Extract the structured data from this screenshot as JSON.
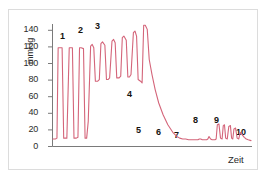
{
  "figure": {
    "background_color": "#ffffff",
    "border_color": "#dcdcdc",
    "trace_color": "#d4657a",
    "axis_color": "#7a7a7a",
    "label_color": "#15120f"
  },
  "axes": {
    "y_title": "mmHg",
    "x_title": "Zeit",
    "y_ticks": [
      "0",
      "20",
      "40",
      "60",
      "80",
      "100",
      "120",
      "140"
    ]
  },
  "annotations": [
    {
      "id": "1",
      "label": "1"
    },
    {
      "id": "2",
      "label": "2"
    },
    {
      "id": "3",
      "label": "3"
    },
    {
      "id": "4",
      "label": "4"
    },
    {
      "id": "5",
      "label": "5"
    },
    {
      "id": "6",
      "label": "6"
    },
    {
      "id": "7",
      "label": "7"
    },
    {
      "id": "8",
      "label": "8"
    },
    {
      "id": "9",
      "label": "9"
    },
    {
      "id": "10",
      "label": "10"
    }
  ],
  "chart_data": {
    "type": "line",
    "title": "",
    "subtitle": "",
    "xlabel": "Zeit",
    "ylabel": "mmHg",
    "ylim": [
      0,
      150
    ],
    "xlim": [
      0,
      100
    ],
    "yticks": [
      0,
      20,
      40,
      60,
      80,
      100,
      120,
      140
    ],
    "xticks": [],
    "grid": false,
    "legend": null,
    "series": [
      {
        "name": "Arterieller Druckverlauf",
        "color": "#d4657a",
        "x": [
          0.0,
          1.2,
          2.0,
          2.6,
          3.4,
          4.6,
          5.4,
          6.2,
          7.0,
          8.2,
          9.0,
          9.8,
          10.6,
          11.8,
          12.6,
          13.4,
          14.2,
          15.4,
          16.2,
          17.0,
          17.8,
          19.0,
          19.8,
          20.6,
          21.4,
          22.6,
          23.4,
          24.2,
          25.0,
          26.2,
          27.0,
          27.8,
          28.6,
          29.8,
          30.6,
          31.4,
          32.2,
          33.4,
          34.2,
          35.0,
          35.8,
          37.0,
          37.8,
          38.6,
          39.4,
          40.6,
          41.4,
          42.2,
          43.0,
          44.2,
          45.0,
          45.8,
          46.6,
          47.6,
          48.6,
          50.0,
          51.6,
          53.4,
          55.6,
          58.0,
          60.5,
          62.5,
          64.0,
          65.5,
          67.0,
          68.5,
          70.0,
          71.5,
          72.5,
          73.2,
          73.9,
          74.6,
          75.4,
          76.2,
          77.0,
          77.6,
          78.2,
          78.8,
          79.6,
          80.4,
          81.2,
          81.8,
          82.4,
          83.0,
          83.8,
          84.6,
          85.4,
          86.0,
          86.6,
          87.2,
          88.0,
          88.8,
          89.6,
          90.2,
          90.8,
          91.4,
          92.2,
          93.0,
          93.8,
          94.6,
          95.6,
          96.6,
          97.6,
          98.6,
          100.0
        ],
        "y": [
          9,
          9,
          10,
          118,
          118,
          118,
          10,
          10,
          10,
          118,
          118,
          118,
          10,
          10,
          11,
          118,
          118,
          117,
          10,
          10,
          30,
          120,
          122,
          118,
          78,
          78,
          80,
          123,
          125,
          121,
          80,
          80,
          82,
          126,
          128,
          124,
          82,
          82,
          84,
          130,
          132,
          127,
          83,
          83,
          86,
          136,
          138,
          132,
          80,
          78,
          76,
          145,
          145,
          140,
          104,
          86,
          68,
          52,
          38,
          26,
          17,
          12,
          10,
          9,
          9,
          8,
          8,
          8,
          8,
          8,
          9,
          9,
          8,
          8,
          8,
          8,
          9,
          12,
          9,
          8,
          8,
          8,
          9,
          26,
          27,
          10,
          9,
          25,
          26,
          10,
          9,
          24,
          25,
          10,
          9,
          21,
          22,
          10,
          9,
          17,
          14,
          11,
          9,
          8,
          7
        ],
        "description": "Oszillometrische Blutdruckmessung - arterielle Druckkurve über die Zeit"
      }
    ],
    "annotations": [
      {
        "label": "1",
        "x": 6.0,
        "y": 128,
        "note": "Erste grosse Oszillation, Basislinie bei 10 mmHg"
      },
      {
        "label": "2",
        "x": 20.5,
        "y": 138,
        "note": "Oszillationen mit ansteigendem Tal (~78 mmHg)"
      },
      {
        "label": "3",
        "x": 31.0,
        "y": 144,
        "note": "Maximale Amplitude der Oszillationen (~145 mmHg)"
      },
      {
        "label": "4",
        "x": 50.5,
        "y": 72,
        "note": "Steiler Druckabfall"
      },
      {
        "label": "5",
        "x": 62.0,
        "y": 22,
        "note": "Erreichen der niedrigen Basislinie"
      },
      {
        "label": "6",
        "x": 71.5,
        "y": 22,
        "note": "Flache Basislinie"
      },
      {
        "label": "7",
        "x": 79.0,
        "y": 18,
        "note": "Kleine Erhebung vor Wiederanstieg"
      },
      {
        "label": "8",
        "x": 84.0,
        "y": 38,
        "note": "Zweite Oszillationsgruppe, Beginn"
      },
      {
        "label": "9",
        "x": 91.5,
        "y": 38,
        "note": "Abnehmende Oszillationen"
      },
      {
        "label": "10",
        "x": 98.5,
        "y": 22,
        "note": "Abklingende Restschwingungen"
      }
    ]
  }
}
